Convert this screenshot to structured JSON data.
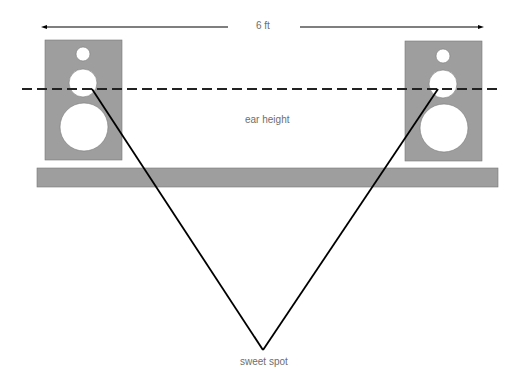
{
  "diagram": {
    "labels": {
      "distance": "6 ft",
      "ear_height": "ear height",
      "sweet_spot": "sweet spot"
    },
    "colors": {
      "cabinet": "#9e9e9e",
      "shelf": "#9e9e9e",
      "driver": "#ffffff",
      "line": "#000000",
      "text": "#6e6e6e"
    },
    "elements": [
      {
        "id": "left-speaker",
        "type": "speaker"
      },
      {
        "id": "right-speaker",
        "type": "speaker"
      },
      {
        "id": "shelf",
        "type": "rectangle"
      },
      {
        "id": "ear-height-line",
        "type": "dashed-line"
      },
      {
        "id": "distance-arrow",
        "type": "double-arrow"
      },
      {
        "id": "listening-triangle",
        "type": "lines"
      }
    ]
  }
}
